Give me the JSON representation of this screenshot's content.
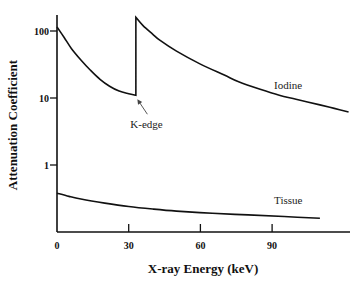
{
  "chart_data": {
    "type": "line",
    "title": "",
    "xlabel": "X-ray Energy (keV)",
    "ylabel": "Attenuation Coefficient",
    "xscale": "linear",
    "yscale": "log",
    "xlim": [
      0,
      122
    ],
    "ylim": [
      0.1,
      200
    ],
    "grid": false,
    "legend": "none",
    "x_ticks": [
      {
        "value": 0,
        "label": "0"
      },
      {
        "value": 30,
        "label": "30"
      },
      {
        "value": 60,
        "label": "60"
      },
      {
        "value": 90,
        "label": "90"
      }
    ],
    "y_ticks": [
      {
        "value": 1,
        "label": "1"
      },
      {
        "value": 10,
        "label": "10"
      },
      {
        "value": 100,
        "label": "100"
      }
    ],
    "series": [
      {
        "name": "Iodine",
        "label": "Iodine",
        "x": [
          0,
          3,
          6,
          10,
          14,
          18,
          22,
          26,
          30,
          33,
          33,
          36,
          40,
          43,
          50,
          60,
          70,
          76,
          85,
          93,
          100,
          110,
          116,
          122
        ],
        "y": [
          115,
          80,
          55,
          37,
          26,
          19,
          15,
          12.7,
          11.6,
          11,
          160,
          120,
          90,
          73,
          50,
          32,
          22,
          17.5,
          13.5,
          11,
          9.6,
          7.9,
          7,
          6.2
        ]
      },
      {
        "name": "Tissue",
        "label": "Tissue",
        "x": [
          0,
          5,
          10,
          20,
          30,
          40,
          50,
          65,
          80,
          95,
          110
        ],
        "y": [
          0.38,
          0.34,
          0.31,
          0.27,
          0.24,
          0.22,
          0.205,
          0.19,
          0.18,
          0.17,
          0.16
        ]
      }
    ],
    "annotations": [
      {
        "text": "K-edge",
        "points_to": {
          "x": 33,
          "y": 11
        },
        "type": "arrow"
      },
      {
        "text": "Iodine",
        "near": {
          "x": 95,
          "y": 11
        }
      },
      {
        "text": "Tissue",
        "near": {
          "x": 95,
          "y": 0.25
        }
      }
    ]
  }
}
